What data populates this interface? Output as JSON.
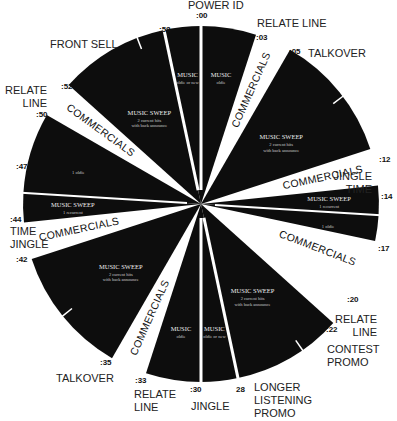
{
  "diagram": {
    "type": "radio-format-clock",
    "center": [
      201,
      204
    ],
    "radius": 178,
    "colors": {
      "segment": "#0d0d0d",
      "gap": "#ffffff",
      "label": "#222222"
    },
    "segments": [
      {
        "id": "s00",
        "start": 0,
        "end": 3,
        "title": "MUSIC",
        "sub": "oldie"
      },
      {
        "id": "s05",
        "start": 5,
        "end": 12,
        "title": "MUSIC SWEEP",
        "sub": "2 current hits with back announce"
      },
      {
        "id": "s14a",
        "start": 14,
        "end": 15.6,
        "title": "MUSIC SWEEP",
        "sub": "1 recurrent"
      },
      {
        "id": "s14b",
        "start": 15.6,
        "end": 17,
        "title": "",
        "sub": "1 oldie"
      },
      {
        "id": "s20",
        "start": 22,
        "end": 28,
        "title": "MUSIC SWEEP",
        "sub": "2 current hits with back announce"
      },
      {
        "id": "s28",
        "start": 28,
        "end": 30,
        "title": "MUSIC",
        "sub": "oldie or new"
      },
      {
        "id": "s30",
        "start": 30,
        "end": 33,
        "title": "MUSIC",
        "sub": "oldie"
      },
      {
        "id": "s42",
        "start": 35,
        "end": 42,
        "title": "MUSIC SWEEP",
        "sub": "2 current hits with back announce"
      },
      {
        "id": "s44",
        "start": 44,
        "end": 45.6,
        "title": "MUSIC SWEEP",
        "sub": "1 recurrent"
      },
      {
        "id": "s47",
        "start": 45.6,
        "end": 50,
        "title": "",
        "sub": "1 oldie"
      },
      {
        "id": "s52",
        "start": 52,
        "end": 58,
        "title": "MUSIC SWEEP",
        "sub": "2 current hits with back announce"
      },
      {
        "id": "s58",
        "start": 58,
        "end": 60,
        "title": "MUSIC",
        "sub": "oldie or new"
      }
    ],
    "commercial_label": "COMMERCIALS",
    "commercials": [
      {
        "start": 3,
        "end": 5
      },
      {
        "start": 12,
        "end": 14
      },
      {
        "start": 17,
        "end": 20
      },
      {
        "start": 33,
        "end": 35
      },
      {
        "start": 42,
        "end": 44
      },
      {
        "start": 50,
        "end": 52
      }
    ],
    "minute_marks": [
      {
        "text": ":00",
        "x": 196,
        "y": 18
      },
      {
        "text": ":03",
        "x": 256,
        "y": 40
      },
      {
        "text": ":05",
        "x": 289,
        "y": 54
      },
      {
        "text": ":12",
        "x": 379,
        "y": 162
      },
      {
        "text": ":14",
        "x": 381,
        "y": 199
      },
      {
        "text": ":17",
        "x": 378,
        "y": 251
      },
      {
        "text": ":20",
        "x": 347,
        "y": 302
      },
      {
        "text": ":22",
        "x": 326,
        "y": 332
      },
      {
        "text": "28",
        "x": 236,
        "y": 392
      },
      {
        "text": ":30",
        "x": 190,
        "y": 392
      },
      {
        "text": ":33",
        "x": 135,
        "y": 383
      },
      {
        "text": ":35",
        "x": 100,
        "y": 365
      },
      {
        "text": ":42",
        "x": 16,
        "y": 262
      },
      {
        "text": ":44",
        "x": 10,
        "y": 222
      },
      {
        "text": ":47",
        "x": 16,
        "y": 169
      },
      {
        "text": ":50",
        "x": 36,
        "y": 117
      },
      {
        "text": ":52",
        "x": 61,
        "y": 89
      },
      {
        "text": ":58",
        "x": 159,
        "y": 32
      }
    ],
    "outer_labels": [
      {
        "lines": [
          "POWER ID"
        ],
        "x": 188,
        "y": 9,
        "anchor": "start"
      },
      {
        "lines": [
          "RELATE LINE"
        ],
        "x": 257,
        "y": 27,
        "anchor": "start"
      },
      {
        "lines": [
          "TALKOVER"
        ],
        "x": 308,
        "y": 57,
        "anchor": "start"
      },
      {
        "lines": [
          "JINGLE",
          "TIME"
        ],
        "x": 372,
        "y": 180,
        "anchor": "end"
      },
      {
        "lines": [
          "RELATE",
          "LINE"
        ],
        "x": 377,
        "y": 323,
        "anchor": "end"
      },
      {
        "lines": [
          "CONTEST",
          "PROMO"
        ],
        "x": 327,
        "y": 353,
        "anchor": "start"
      },
      {
        "lines": [
          "LONGER",
          "LISTENING",
          "PROMO"
        ],
        "x": 254,
        "y": 391,
        "anchor": "start"
      },
      {
        "lines": [
          "JINGLE"
        ],
        "x": 191,
        "y": 410,
        "anchor": "start"
      },
      {
        "lines": [
          "RELATE",
          "LINE"
        ],
        "x": 134,
        "y": 398,
        "anchor": "start"
      },
      {
        "lines": [
          "TALKOVER"
        ],
        "x": 56,
        "y": 382,
        "anchor": "start"
      },
      {
        "lines": [
          "TIME",
          "JINGLE"
        ],
        "x": 10,
        "y": 235,
        "anchor": "start"
      },
      {
        "lines": [
          "RELATE",
          "LINE"
        ],
        "x": 47,
        "y": 94,
        "anchor": "end"
      },
      {
        "lines": [
          "FRONT SELL"
        ],
        "x": 50,
        "y": 48,
        "anchor": "start"
      }
    ],
    "ticks": [
      {
        "minute": 56.5,
        "note": "front sell"
      },
      {
        "minute": 8.8,
        "note": "talkover"
      },
      {
        "minute": 24.2,
        "note": "contest promo"
      },
      {
        "minute": 38.5,
        "note": "talkover"
      }
    ]
  }
}
